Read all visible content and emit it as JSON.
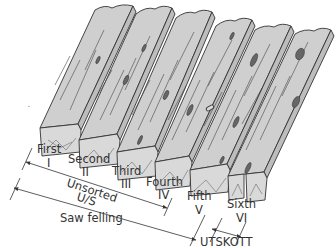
{
  "diagram": {
    "boards": [
      {
        "name": "First",
        "numeral": "I"
      },
      {
        "name": "Second",
        "numeral": "II"
      },
      {
        "name": "Third",
        "numeral": "III"
      },
      {
        "name": "Fourth",
        "numeral": "IV"
      },
      {
        "name": "Fifth",
        "numeral": "V"
      },
      {
        "name": "Sixth",
        "numeral": "VI"
      }
    ],
    "groups": {
      "unsorted_label": "Unsorted",
      "unsorted_abbr": "U/S",
      "saw_felling_label": "Saw felling",
      "utskott_label": "UTSKOTT"
    },
    "colors": {
      "board_fill": "#cfcfcf",
      "line": "#333333",
      "background": "#ffffff"
    }
  }
}
